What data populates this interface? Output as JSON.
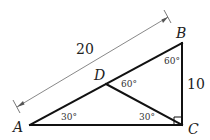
{
  "diagram": {
    "points": {
      "A": {
        "label": "A"
      },
      "B": {
        "label": "B"
      },
      "C": {
        "label": "C"
      },
      "D": {
        "label": "D"
      }
    },
    "lengths": {
      "AB": "20",
      "BC": "10"
    },
    "angles": {
      "A": "30°",
      "B": "60°",
      "D_BDC": "60°",
      "C_DCA": "30°"
    },
    "right_angle_at": "C",
    "colors": {
      "edge": "#111111",
      "dimension": "#555555"
    }
  }
}
